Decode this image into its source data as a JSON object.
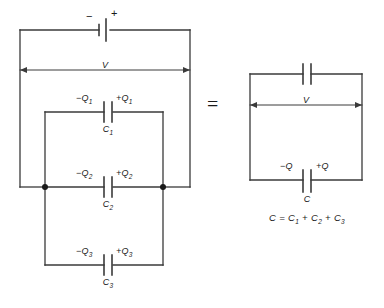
{
  "figure": {
    "type": "circuit-diagram",
    "background_color": "#ffffff",
    "line_color": "#3a3a3a",
    "text_color": "#1a1a1a"
  },
  "left_circuit": {
    "name": "parallel-capacitor-network",
    "battery": {
      "negative_label": "−",
      "positive_label": "+"
    },
    "voltage_label": "V",
    "branches": [
      {
        "capacitor_label": "C",
        "capacitor_sub": "1",
        "negative_charge": "−Q",
        "negative_charge_sub": "1",
        "positive_charge": "+Q",
        "positive_charge_sub": "1"
      },
      {
        "capacitor_label": "C",
        "capacitor_sub": "2",
        "negative_charge": "−Q",
        "negative_charge_sub": "2",
        "positive_charge": "+Q",
        "positive_charge_sub": "2"
      },
      {
        "capacitor_label": "C",
        "capacitor_sub": "3",
        "negative_charge": "−Q",
        "negative_charge_sub": "3",
        "positive_charge": "+Q",
        "positive_charge_sub": "3"
      }
    ]
  },
  "equals_sign": "=",
  "right_circuit": {
    "name": "equivalent-capacitor-network",
    "voltage_label": "V",
    "capacitor_label": "C",
    "negative_charge": "−Q",
    "positive_charge": "+Q"
  },
  "equation": {
    "lhs": "C",
    "operator": "=",
    "term1": "C",
    "term1_sub": "1",
    "plus1": "+",
    "term2": "C",
    "term2_sub": "2",
    "plus2": "+",
    "term3": "C",
    "term3_sub": "3"
  }
}
